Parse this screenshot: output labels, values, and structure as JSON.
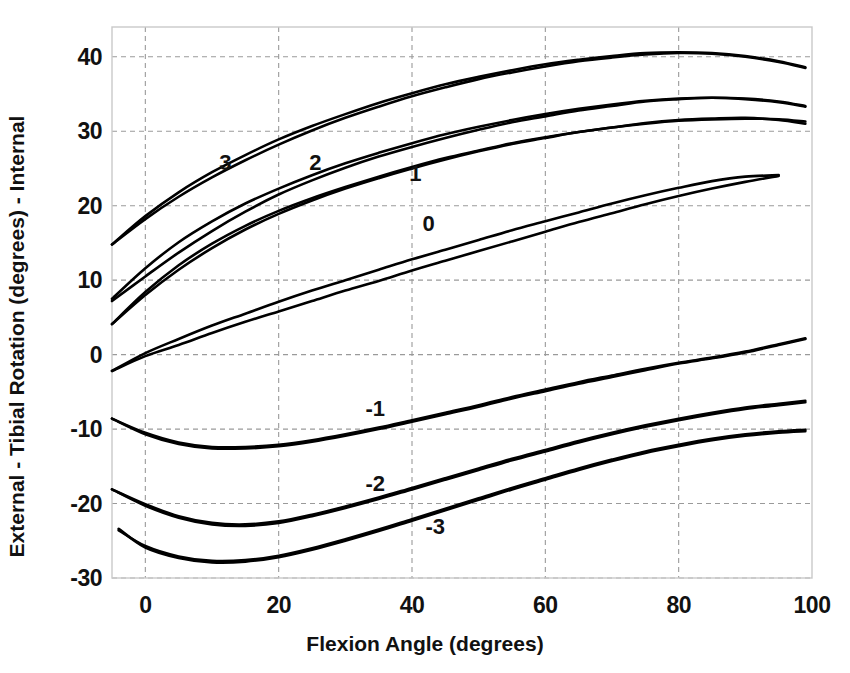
{
  "chart_data": {
    "type": "line",
    "title": "",
    "xlabel": "Flexion Angle (degrees)",
    "ylabel": "External  -  Tibial Rotation (degrees)  -  Internal",
    "xlim": [
      -5,
      100
    ],
    "ylim": [
      -30,
      44
    ],
    "xticks": [
      0,
      20,
      40,
      60,
      80,
      100
    ],
    "xtick_labels": [
      "0",
      "20",
      "40",
      "60",
      "80",
      "100"
    ],
    "yticks": [
      -30,
      -20,
      -10,
      0,
      10,
      20,
      30,
      40
    ],
    "ytick_labels": [
      "-30",
      "-20",
      "-10",
      "0",
      "10",
      "20",
      "30",
      "40"
    ],
    "grid": true,
    "grid_style": "dashed",
    "legend": "inline-curve-labels",
    "line_color": "#000000",
    "series": [
      {
        "name": "3",
        "label": "3",
        "label_x": 12,
        "label_y": 25.8,
        "x": [
          -5,
          0,
          5,
          10,
          15,
          20,
          25,
          30,
          35,
          40,
          45,
          50,
          55,
          60,
          65,
          70,
          75,
          80,
          85,
          90,
          95,
          99
        ],
        "y": [
          14.8,
          18.6,
          21.8,
          24.5,
          26.8,
          28.9,
          30.7,
          32.3,
          33.8,
          35.1,
          36.3,
          37.3,
          38.2,
          39.0,
          39.6,
          40.1,
          40.5,
          40.6,
          40.5,
          40.1,
          39.4,
          38.6
        ]
      },
      {
        "name": "3b",
        "label": "",
        "label_x": null,
        "label_y": null,
        "x": [
          -5,
          0,
          5,
          10,
          15,
          20,
          25,
          30,
          35,
          40,
          45,
          50,
          55,
          60,
          65,
          70,
          75,
          80,
          85,
          90,
          95,
          99
        ],
        "y": [
          14.8,
          18.2,
          21.2,
          23.8,
          26.1,
          28.2,
          30.1,
          31.8,
          33.3,
          34.7,
          35.9,
          37.0,
          37.9,
          38.7,
          39.4,
          39.9,
          40.3,
          40.5,
          40.4,
          40.0,
          39.3,
          38.5
        ]
      },
      {
        "name": "2",
        "label": "2",
        "label_x": 25.5,
        "label_y": 25.7,
        "x": [
          -5,
          0,
          5,
          10,
          15,
          20,
          25,
          30,
          35,
          40,
          45,
          50,
          55,
          60,
          65,
          70,
          75,
          80,
          85,
          90,
          95,
          99
        ],
        "y": [
          7.5,
          11.6,
          15.1,
          17.9,
          20.3,
          22.3,
          24.1,
          25.7,
          27.1,
          28.4,
          29.6,
          30.6,
          31.5,
          32.3,
          33.0,
          33.6,
          34.1,
          34.4,
          34.5,
          34.4,
          34.0,
          33.4
        ]
      },
      {
        "name": "2b",
        "label": "",
        "label_x": null,
        "label_y": null,
        "x": [
          -5,
          0,
          5,
          10,
          15,
          20,
          25,
          30,
          35,
          40,
          45,
          50,
          55,
          60,
          65,
          70,
          75,
          80,
          85,
          90,
          95,
          99
        ],
        "y": [
          7.2,
          10.5,
          13.7,
          16.6,
          19.2,
          21.5,
          23.4,
          25.1,
          26.6,
          27.9,
          29.1,
          30.2,
          31.2,
          32.0,
          32.8,
          33.4,
          34.0,
          34.3,
          34.5,
          34.3,
          33.9,
          33.3
        ]
      },
      {
        "name": "1",
        "label": "1",
        "label_x": 40.5,
        "label_y": 24.3,
        "x": [
          -5,
          0,
          5,
          10,
          15,
          20,
          25,
          30,
          35,
          40,
          45,
          50,
          55,
          60,
          65,
          70,
          75,
          80,
          85,
          90,
          95,
          99
        ],
        "y": [
          4.1,
          8.4,
          12.0,
          14.9,
          17.3,
          19.3,
          21.0,
          22.5,
          23.9,
          25.2,
          26.4,
          27.4,
          28.4,
          29.2,
          29.9,
          30.5,
          31.0,
          31.4,
          31.6,
          31.7,
          31.6,
          31.3
        ]
      },
      {
        "name": "1b",
        "label": "",
        "label_x": null,
        "label_y": null,
        "x": [
          -5,
          0,
          5,
          10,
          15,
          20,
          25,
          30,
          35,
          40,
          45,
          50,
          55,
          60,
          65,
          70,
          75,
          80,
          85,
          90,
          95,
          99
        ],
        "y": [
          4.1,
          8.0,
          11.4,
          14.3,
          16.8,
          18.9,
          20.7,
          22.3,
          23.7,
          25.0,
          26.2,
          27.3,
          28.3,
          29.1,
          29.9,
          30.5,
          31.1,
          31.5,
          31.7,
          31.8,
          31.5,
          31.0
        ]
      },
      {
        "name": "0",
        "label": "0",
        "label_x": 42.5,
        "label_y": 17.6,
        "x": [
          -5,
          0,
          5,
          10,
          15,
          20,
          25,
          30,
          35,
          40,
          45,
          50,
          55,
          60,
          65,
          70,
          75,
          80,
          85,
          90,
          95
        ],
        "y": [
          -2.2,
          0.2,
          2.1,
          3.9,
          5.5,
          7.1,
          8.6,
          10.0,
          11.4,
          12.8,
          14.1,
          15.4,
          16.7,
          17.9,
          19.1,
          20.3,
          21.4,
          22.4,
          23.3,
          23.9,
          24.1
        ]
      },
      {
        "name": "0b",
        "label": "",
        "label_x": null,
        "label_y": null,
        "x": [
          -5,
          0,
          5,
          10,
          15,
          20,
          25,
          30,
          35,
          40,
          45,
          50,
          55,
          60,
          65,
          70,
          75,
          80,
          85,
          90,
          95
        ],
        "y": [
          -2.2,
          -0.2,
          1.3,
          2.9,
          4.4,
          5.8,
          7.2,
          8.6,
          9.9,
          11.3,
          12.6,
          13.9,
          15.2,
          16.5,
          17.8,
          19.0,
          20.2,
          21.3,
          22.3,
          23.2,
          24.0
        ]
      },
      {
        "name": "-1",
        "label": "-1",
        "label_x": 34.5,
        "label_y": -7.3,
        "x": [
          -5,
          0,
          5,
          10,
          15,
          20,
          25,
          30,
          35,
          40,
          45,
          50,
          55,
          60,
          65,
          70,
          75,
          80,
          85,
          90,
          95,
          99
        ],
        "y": [
          -8.6,
          -10.5,
          -11.8,
          -12.4,
          -12.4,
          -12.1,
          -11.5,
          -10.7,
          -9.8,
          -8.8,
          -7.8,
          -6.8,
          -5.7,
          -4.7,
          -3.7,
          -2.8,
          -1.9,
          -1.1,
          -0.4,
          0.4,
          1.4,
          2.2
        ]
      },
      {
        "name": "-1b",
        "label": "",
        "label_x": null,
        "label_y": null,
        "x": [
          -5,
          0,
          5,
          10,
          15,
          20,
          25,
          30,
          35,
          40,
          45,
          50,
          55,
          60,
          65,
          70,
          75,
          80,
          85,
          90,
          95,
          99
        ],
        "y": [
          -8.6,
          -10.7,
          -12.0,
          -12.6,
          -12.6,
          -12.3,
          -11.7,
          -10.9,
          -10.0,
          -9.0,
          -8.0,
          -7.0,
          -5.9,
          -4.9,
          -3.9,
          -3.0,
          -2.1,
          -1.2,
          -0.5,
          0.3,
          1.3,
          2.1
        ]
      },
      {
        "name": "-2",
        "label": "-2",
        "label_x": 34.5,
        "label_y": -17.4,
        "x": [
          -5,
          0,
          5,
          10,
          15,
          20,
          25,
          30,
          35,
          40,
          45,
          50,
          55,
          60,
          65,
          70,
          75,
          80,
          85,
          90,
          95,
          99
        ],
        "y": [
          -18.1,
          -20.1,
          -21.7,
          -22.6,
          -22.8,
          -22.4,
          -21.5,
          -20.4,
          -19.2,
          -17.9,
          -16.6,
          -15.3,
          -14.0,
          -12.8,
          -11.6,
          -10.5,
          -9.5,
          -8.6,
          -7.8,
          -7.1,
          -6.6,
          -6.2
        ]
      },
      {
        "name": "-2b",
        "label": "",
        "label_x": null,
        "label_y": null,
        "x": [
          -5,
          0,
          5,
          10,
          15,
          20,
          25,
          30,
          35,
          40,
          45,
          50,
          55,
          60,
          65,
          70,
          75,
          80,
          85,
          90,
          95,
          99
        ],
        "y": [
          -18.1,
          -20.3,
          -21.9,
          -22.8,
          -23.0,
          -22.6,
          -21.7,
          -20.6,
          -19.4,
          -18.1,
          -16.8,
          -15.5,
          -14.2,
          -13.0,
          -11.8,
          -10.7,
          -9.7,
          -8.8,
          -8.0,
          -7.3,
          -6.8,
          -6.4
        ]
      },
      {
        "name": "-3",
        "label": "-3",
        "label_x": 43.5,
        "label_y": -23.2,
        "x": [
          -4,
          0,
          5,
          10,
          15,
          20,
          25,
          30,
          35,
          40,
          45,
          50,
          55,
          60,
          65,
          70,
          75,
          80,
          85,
          90,
          95,
          99
        ],
        "y": [
          -23.6,
          -25.7,
          -27.1,
          -27.7,
          -27.6,
          -27.0,
          -26.0,
          -24.8,
          -23.5,
          -22.1,
          -20.7,
          -19.3,
          -17.9,
          -16.6,
          -15.3,
          -14.1,
          -13.0,
          -12.1,
          -11.3,
          -10.7,
          -10.3,
          -10.1
        ]
      },
      {
        "name": "-3b",
        "label": "",
        "label_x": null,
        "label_y": null,
        "x": [
          -4,
          0,
          5,
          10,
          15,
          20,
          25,
          30,
          35,
          40,
          45,
          50,
          55,
          60,
          65,
          70,
          75,
          80,
          85,
          90,
          95,
          99
        ],
        "y": [
          -23.4,
          -25.9,
          -27.3,
          -27.9,
          -27.8,
          -27.2,
          -26.2,
          -25.0,
          -23.7,
          -22.3,
          -20.9,
          -19.5,
          -18.1,
          -16.8,
          -15.5,
          -14.3,
          -13.2,
          -12.3,
          -11.5,
          -10.9,
          -10.5,
          -10.3
        ]
      }
    ]
  }
}
